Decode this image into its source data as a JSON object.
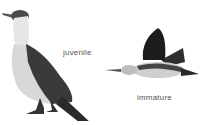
{
  "illustration": {
    "birds": [
      {
        "label": "juvenile",
        "pose": "standing",
        "colors": {
          "back": "#3a3a3a",
          "belly": "#d8d8d8",
          "neck": "#e6e6e6"
        }
      },
      {
        "label": "immature",
        "pose": "flying",
        "colors": {
          "wing": "#1c1c1c",
          "belly": "#cfcfcf",
          "head": "#bdbdbd"
        }
      }
    ]
  }
}
